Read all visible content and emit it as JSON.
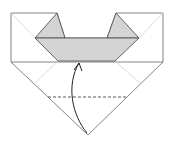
{
  "diagram": {
    "type": "origami-fold-step",
    "colors": {
      "paper": "#ffffff",
      "paper_colored": "#d4d4d4",
      "outline": "#555555",
      "crease": "#c8c8c8",
      "dashed": "#444444",
      "arrow": "#222222"
    },
    "elements": {
      "square_outline": "11,13 57,13 35,38 65,38 107,38 116,13 163,13 163,62 88,135 11,62",
      "left_flap": "57,13 35,38 65,38",
      "right_flap": "116,13 107,38 139,38",
      "band": "35,38 139,38 115,61 58,61",
      "fold_line": {
        "x1": 48,
        "y1": 97,
        "x2": 128,
        "y2": 97
      },
      "arrow_path": "M87,133 C72,115 66,85 79,63"
    }
  }
}
